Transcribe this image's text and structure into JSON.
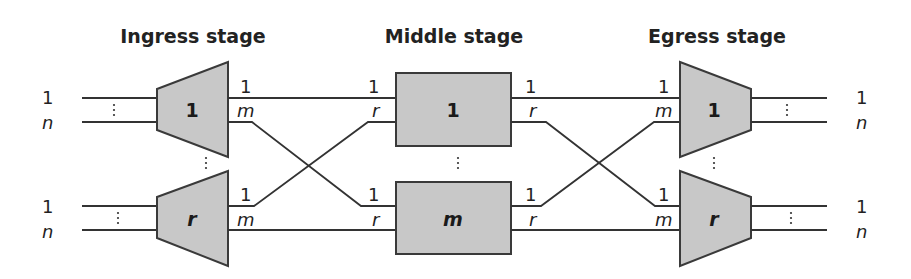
{
  "stages": {
    "ingress": {
      "title": "Ingress stage",
      "blocks": [
        {
          "label": "1",
          "italic": false
        },
        {
          "label": "r",
          "italic": true
        }
      ]
    },
    "middle": {
      "title": "Middle stage",
      "blocks": [
        {
          "label": "1",
          "italic": false
        },
        {
          "label": "m",
          "italic": true
        }
      ]
    },
    "egress": {
      "title": "Egress stage",
      "blocks": [
        {
          "label": "1",
          "italic": false
        },
        {
          "label": "r",
          "italic": true
        }
      ]
    }
  },
  "ports": {
    "external_first": "1",
    "external_last": "n",
    "ingress_out_first": "1",
    "ingress_out_last": "m",
    "middle_in_first": "1",
    "middle_in_last": "r",
    "middle_out_first": "1",
    "middle_out_last": "r",
    "egress_in_first": "1",
    "egress_in_last": "m"
  },
  "colors": {
    "block_fill": "#c8c8c8",
    "block_stroke": "#3a3a3a",
    "wire": "#333333",
    "text": "#222222"
  }
}
